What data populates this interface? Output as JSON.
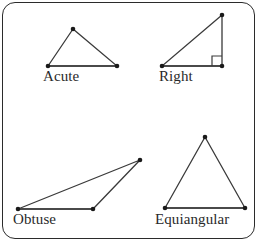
{
  "figure": {
    "frame": {
      "stroke_color": "#2b2b2b",
      "corner_radius": 13
    },
    "line_color": "#3a3a3a",
    "vertex_color": "#1a1a1a",
    "label_color": "#2a2a2a"
  },
  "triangles": [
    {
      "id": "acute",
      "label": "Acute",
      "description": "Triangle with all three angles less than 90 degrees",
      "vertices": [
        [
          73,
          29
        ],
        [
          48,
          66
        ],
        [
          117,
          66
        ]
      ],
      "base_edge": [
        [
          48,
          66
        ],
        [
          117,
          66
        ]
      ],
      "right_angle_marker": null
    },
    {
      "id": "right",
      "label": "Right",
      "description": "Triangle with one 90 degree angle",
      "vertices": [
        [
          222,
          15
        ],
        [
          162,
          66
        ],
        [
          222,
          66
        ]
      ],
      "base_edge": [
        [
          162,
          66
        ],
        [
          222,
          66
        ]
      ],
      "right_angle_marker": {
        "corner": [
          222,
          66
        ],
        "size": 10
      }
    },
    {
      "id": "obtuse",
      "label": "Obtuse",
      "description": "Triangle with one angle greater than 90 degrees",
      "vertices": [
        [
          140,
          160
        ],
        [
          18,
          209
        ],
        [
          93,
          209
        ]
      ],
      "base_edge": [
        [
          18,
          209
        ],
        [
          93,
          209
        ]
      ],
      "right_angle_marker": null
    },
    {
      "id": "equiangular",
      "label": "Equiangular",
      "description": "Triangle with three equal 60 degree angles",
      "vertices": [
        [
          205,
          137
        ],
        [
          165,
          208
        ],
        [
          245,
          208
        ]
      ],
      "base_edge": [
        [
          165,
          208
        ],
        [
          245,
          208
        ]
      ],
      "right_angle_marker": null
    }
  ]
}
